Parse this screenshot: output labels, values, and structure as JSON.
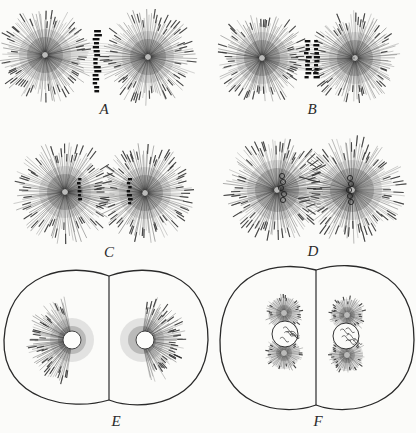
{
  "figure": {
    "panels": [
      {
        "id": "A",
        "label": "A",
        "cx": 103,
        "cy": 58,
        "type": "aster-pair",
        "chromosomes": "equatorial-plate"
      },
      {
        "id": "B",
        "label": "B",
        "cx": 313,
        "cy": 58,
        "type": "aster-pair",
        "chromosomes": "split-plate"
      },
      {
        "id": "C",
        "label": "C",
        "cx": 103,
        "cy": 188,
        "type": "aster-pair",
        "chromosomes": "separating"
      },
      {
        "id": "D",
        "label": "D",
        "cx": 313,
        "cy": 188,
        "type": "aster-pair",
        "chromosomes": "daughter-nuclei-forming"
      },
      {
        "id": "E",
        "label": "E",
        "cx": 105,
        "cy": 342,
        "type": "two-cell",
        "chromosomes": "resting-nuclei-with-half-asters"
      },
      {
        "id": "F",
        "label": "F",
        "cx": 313,
        "cy": 342,
        "type": "two-cell",
        "chromosomes": "nuclei-with-divided-centrosomes"
      }
    ],
    "colors": {
      "ink": "#2a2a2a",
      "paper": "#fbfbf9",
      "shade": "#8a8a8a"
    }
  }
}
